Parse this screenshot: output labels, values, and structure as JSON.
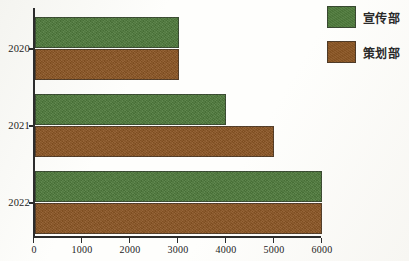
{
  "chart_data": {
    "type": "bar",
    "orientation": "horizontal",
    "title": "",
    "xlabel": "",
    "ylabel": "",
    "categories": [
      "2020",
      "2021",
      "2022"
    ],
    "series": [
      {
        "name": "宣传部",
        "color": "#4f7a3c",
        "values": [
          3000,
          4000,
          6000
        ]
      },
      {
        "name": "策划部",
        "color": "#8a5524",
        "values": [
          3000,
          5000,
          6000
        ]
      }
    ],
    "xlim": [
      0,
      6000
    ],
    "xticks": [
      0,
      1000,
      2000,
      3000,
      4000,
      5000,
      6000
    ],
    "xtick_labels": [
      "0",
      "1000",
      "2000",
      "3000",
      "4000",
      "5000",
      "6000"
    ],
    "grid": false,
    "legend_position": "top-right"
  },
  "legend": {
    "entries": [
      {
        "label": "宣传部",
        "color": "#4f7a3c"
      },
      {
        "label": "策划部",
        "color": "#8a5524"
      }
    ]
  },
  "axes": {
    "y_labels": [
      "2020",
      "2021",
      "2022"
    ],
    "x_labels": [
      "0",
      "1000",
      "2000",
      "3000",
      "4000",
      "5000",
      "6000"
    ]
  }
}
